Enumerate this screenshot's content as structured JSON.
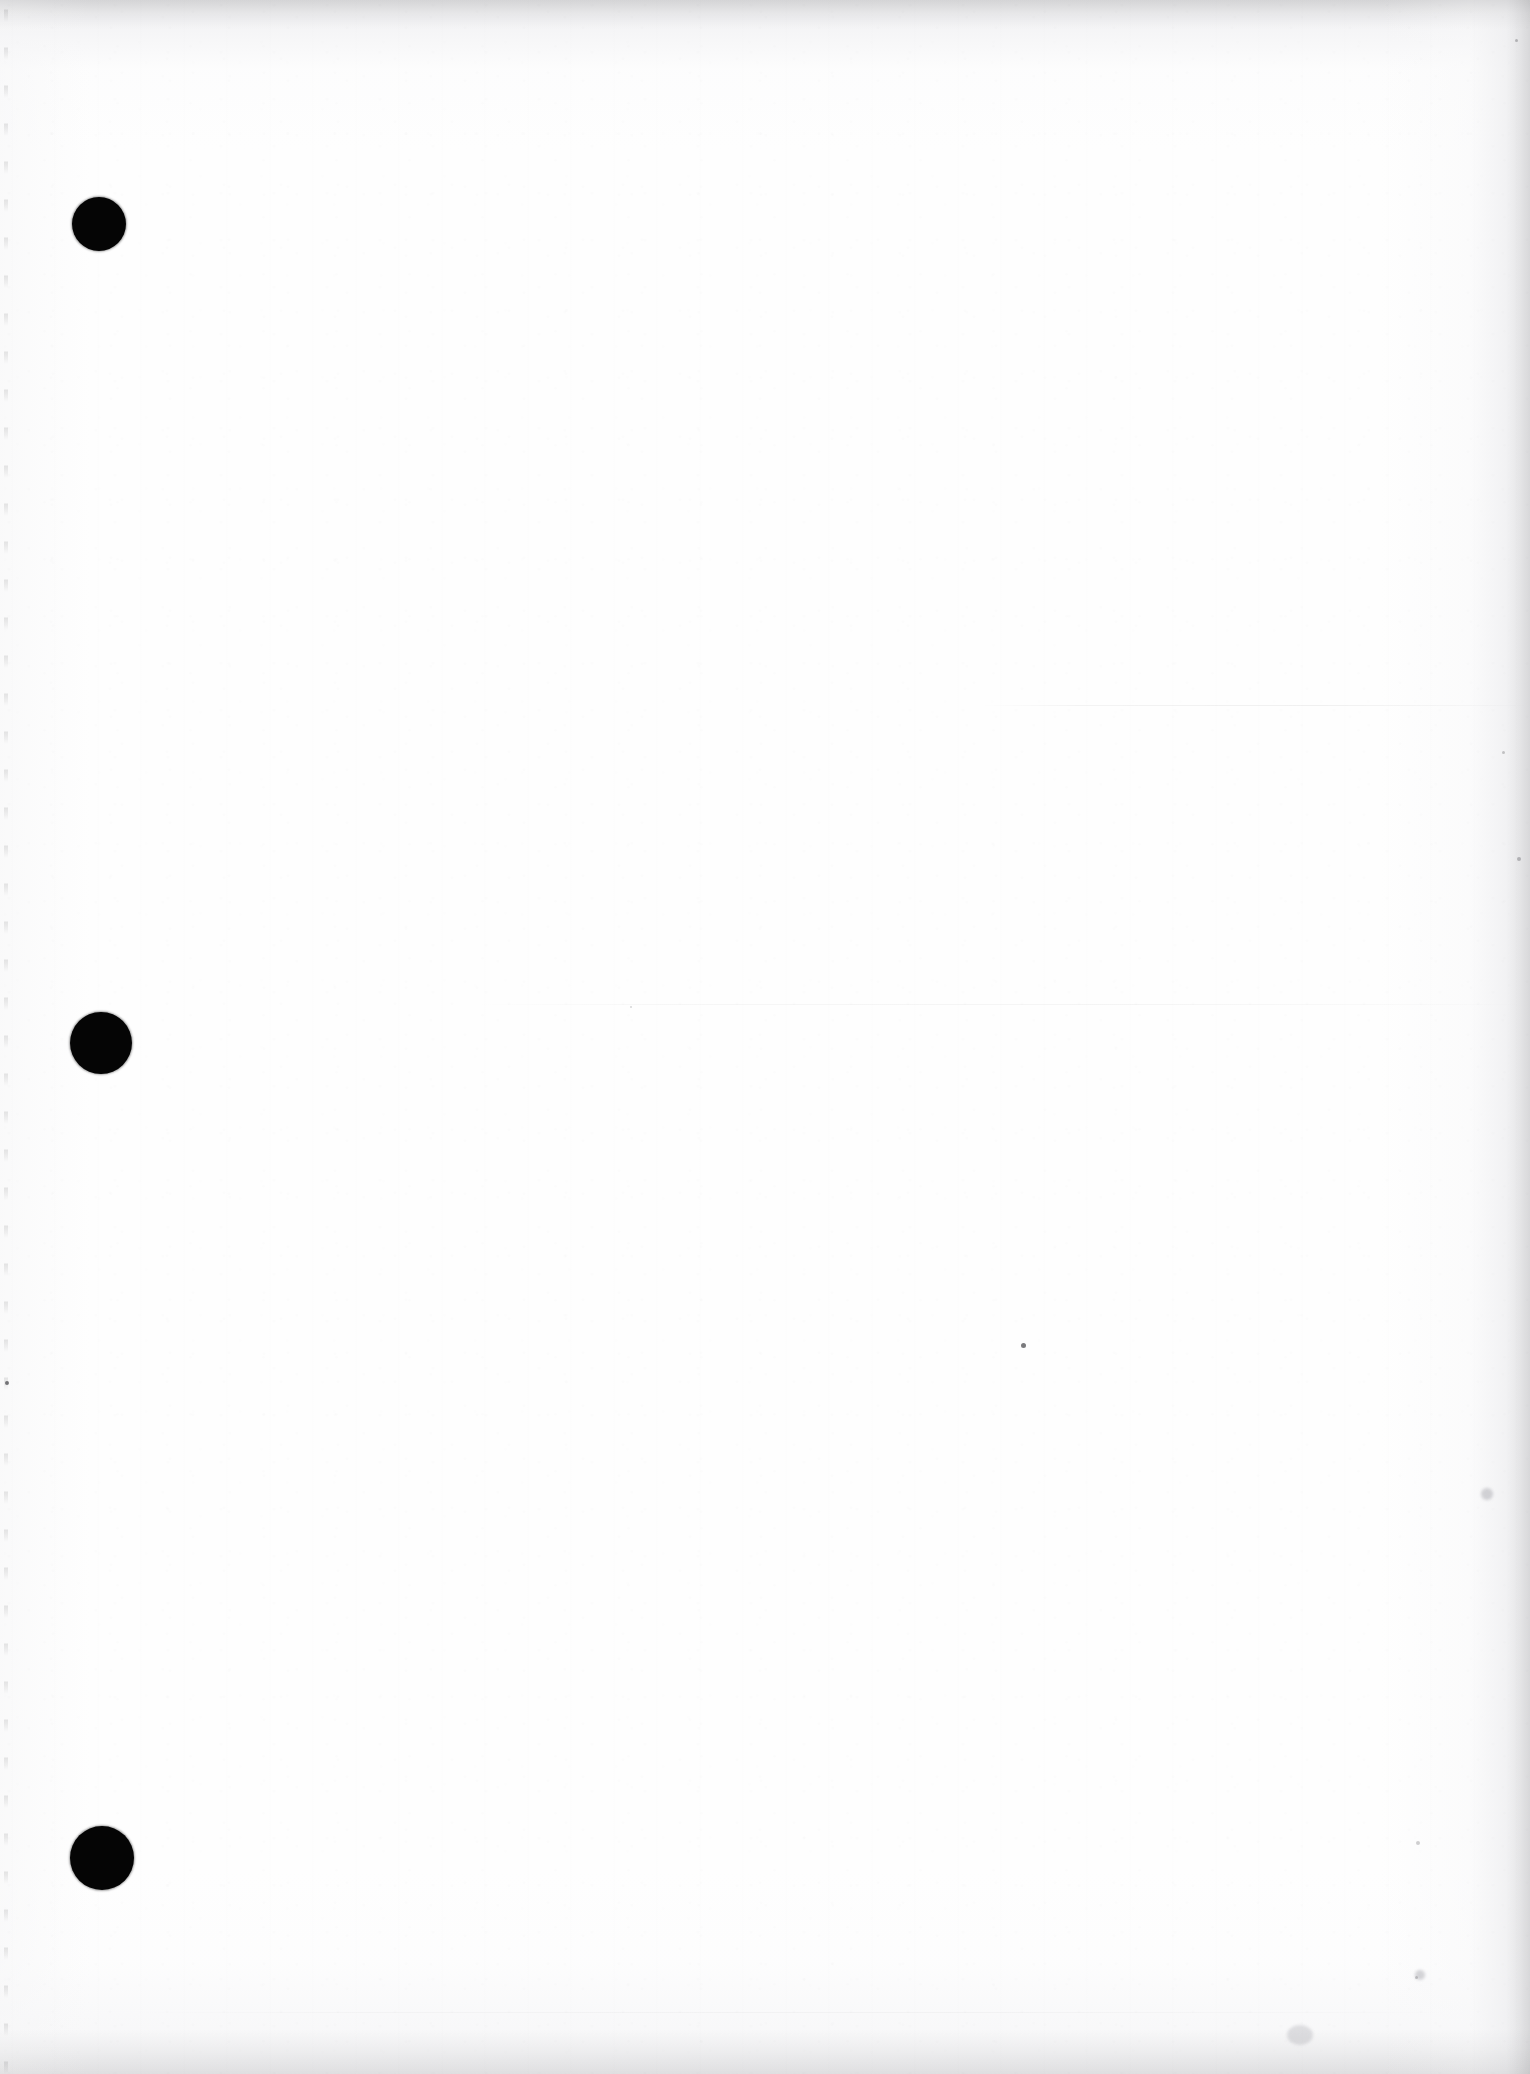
{
  "document": {
    "kind": "scanned-page",
    "page_state": "blank",
    "visible_text": "",
    "width_px": 1530,
    "height_px": 2074,
    "orientation": "portrait"
  },
  "colors": {
    "paper_white": "#fefefe",
    "paper_shade": "#f5f5f6",
    "edge_shadow": "#e8e8ea",
    "hole_black": "#050505",
    "speck_gray": "#282830"
  },
  "binding": {
    "style": "three-hole-punch",
    "edge": "left",
    "hole_count": 3,
    "holes": [
      {
        "label": "top-hole",
        "cx": 99,
        "cy": 224,
        "d": 54
      },
      {
        "label": "middle-hole",
        "cx": 101,
        "cy": 1043,
        "d": 62
      },
      {
        "label": "bottom-hole",
        "cx": 102,
        "cy": 1858,
        "d": 64
      }
    ]
  },
  "scan_artifacts": {
    "seams": [
      {
        "label": "seam-upper",
        "x": 980,
        "y": 705,
        "w": 550
      },
      {
        "label": "seam-lower",
        "x": 470,
        "y": 1004,
        "w": 1060
      },
      {
        "label": "seam-bottom",
        "x": 120,
        "y": 2012,
        "w": 1340
      }
    ],
    "specks": [
      {
        "label": "speck-center",
        "x": 1023,
        "y": 1345,
        "d": 5
      },
      {
        "label": "speck-left-edge",
        "x": 7,
        "y": 1383,
        "d": 4
      },
      {
        "label": "speck-right-upper",
        "x": 1516,
        "y": 40,
        "d": 3
      },
      {
        "label": "speck-right-mid",
        "x": 1503,
        "y": 752,
        "d": 3
      },
      {
        "label": "speck-right-low",
        "x": 1519,
        "y": 859,
        "d": 4
      },
      {
        "label": "speck-lower-right",
        "x": 1416,
        "y": 1977,
        "d": 3
      },
      {
        "label": "speck-bottom-band",
        "x": 1418,
        "y": 1843,
        "d": 4
      },
      {
        "label": "speck-midfield",
        "x": 631,
        "y": 1007,
        "d": 2
      }
    ],
    "smudges": [
      {
        "label": "smudge-right-margin",
        "x": 1487,
        "y": 1494,
        "d": 12
      },
      {
        "label": "smudge-bottom-right",
        "x": 1420,
        "y": 1975,
        "d": 10
      },
      {
        "label": "smudge-bottom-band",
        "x": 1300,
        "y": 2035,
        "d": 26
      }
    ],
    "shadow_edges": [
      "top",
      "bottom",
      "right",
      "left"
    ]
  }
}
